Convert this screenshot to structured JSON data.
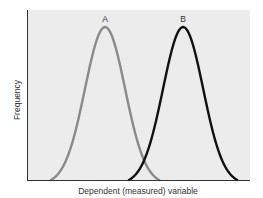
{
  "chart_data": {
    "type": "line",
    "title": "",
    "xlabel": "Dependent (measured) variable",
    "ylabel": "Frequency",
    "xlim": [
      0,
      100
    ],
    "ylim": [
      0,
      1
    ],
    "x_ticks": [],
    "y_ticks": [],
    "grid": false,
    "legend": "none (curves labeled directly above peaks)",
    "series": [
      {
        "name": "A",
        "shape": "normal distribution",
        "mean": 35,
        "std": 9,
        "peak": 0.9,
        "color": "#8a8a8a",
        "x": [
          10,
          20,
          25,
          30,
          35,
          40,
          45,
          50,
          60
        ],
        "values": [
          0.0,
          0.22,
          0.49,
          0.77,
          0.9,
          0.77,
          0.49,
          0.22,
          0.0
        ]
      },
      {
        "name": "B",
        "shape": "normal distribution",
        "mean": 70,
        "std": 9,
        "peak": 0.9,
        "color": "#111111",
        "x": [
          46,
          55,
          60,
          65,
          70,
          75,
          80,
          85,
          95
        ],
        "values": [
          0.0,
          0.22,
          0.49,
          0.77,
          0.9,
          0.77,
          0.49,
          0.22,
          0.0
        ]
      }
    ],
    "annotations": [
      {
        "text": "A",
        "at": "peak of series A"
      },
      {
        "text": "B",
        "at": "peak of series B"
      }
    ]
  },
  "labels": {
    "x_axis": "Dependent (measured) variable",
    "y_axis": "Frequency",
    "curve_a": "A",
    "curve_b": "B"
  },
  "colors": {
    "plot_background": "#ececec",
    "curve_a": "#8a8a8a",
    "curve_b": "#111111",
    "axis": "#333333"
  }
}
